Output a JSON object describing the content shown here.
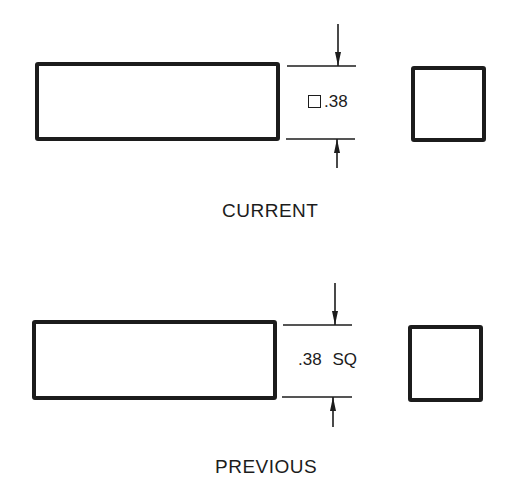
{
  "figures": [
    {
      "caption": "CURRENT",
      "dimension": {
        "symbol": "square-symbol",
        "value": ".38",
        "suffix": ""
      }
    },
    {
      "caption": "PREVIOUS",
      "dimension": {
        "symbol": "",
        "value": ".38",
        "suffix": "SQ"
      }
    }
  ],
  "colors": {
    "line": "#1c1c1c",
    "background": "#ffffff"
  }
}
